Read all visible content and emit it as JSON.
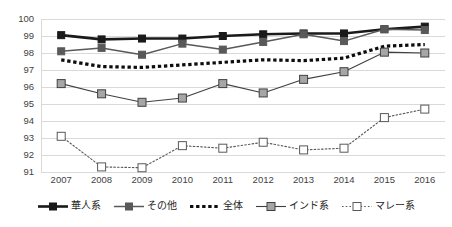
{
  "chart_data": {
    "type": "line",
    "title": "",
    "subtitle": "",
    "xlabel": "",
    "ylabel": "",
    "categories": [
      "2007",
      "2008",
      "2009",
      "2010",
      "2011",
      "2012",
      "2013",
      "2014",
      "2015",
      "2016"
    ],
    "x_tick_labels": [
      "2007",
      "2008",
      "2009",
      "2010",
      "2011",
      "2012",
      "2013",
      "2014",
      "2015",
      "2016"
    ],
    "y_tick_labels": [
      "100",
      "99",
      "98",
      "97",
      "96",
      "95",
      "94",
      "93",
      "92",
      "91"
    ],
    "ylim": [
      91,
      100
    ],
    "y_tick_step": 1,
    "grid": "horizontal",
    "legend_position": "bottom",
    "series": [
      {
        "name": "華人系",
        "values": [
          99.05,
          98.8,
          98.85,
          98.85,
          99.0,
          99.1,
          99.15,
          99.15,
          99.4,
          99.55
        ],
        "color": "#1a1a1a",
        "line_style": "solid",
        "line_width": 2.6,
        "marker": "square-filled",
        "marker_fill": "#1a1a1a",
        "marker_size": 7
      },
      {
        "name": "その他",
        "values": [
          98.1,
          98.3,
          97.9,
          98.55,
          98.2,
          98.65,
          99.1,
          98.7,
          99.4,
          99.35
        ],
        "color": "#595959",
        "line_style": "solid",
        "line_width": 1.5,
        "marker": "square-filled",
        "marker_fill": "#595959",
        "marker_size": 7
      },
      {
        "name": "全体",
        "values": [
          97.6,
          97.2,
          97.15,
          97.3,
          97.45,
          97.6,
          97.55,
          97.7,
          98.4,
          98.5
        ],
        "color": "#0d0d0d",
        "line_style": "dotted-thick",
        "line_width": 3.2,
        "marker": "none",
        "marker_fill": "none",
        "marker_size": 0
      },
      {
        "name": "インド系",
        "values": [
          96.2,
          95.6,
          95.1,
          95.35,
          96.2,
          95.65,
          96.45,
          96.9,
          98.05,
          98.0
        ],
        "color": "#404040",
        "line_style": "solid",
        "line_width": 1.1,
        "marker": "square-filled",
        "marker_fill": "#a6a6a6",
        "marker_size": 8
      },
      {
        "name": "マレー系",
        "values": [
          93.1,
          91.3,
          91.25,
          92.55,
          92.4,
          92.75,
          92.3,
          92.4,
          94.2,
          94.7
        ],
        "color": "#595959",
        "line_style": "dotted-fine",
        "line_width": 1.1,
        "marker": "square-open",
        "marker_fill": "#ffffff",
        "marker_size": 8
      }
    ]
  },
  "legend": {
    "items": [
      {
        "label": "華人系"
      },
      {
        "label": "その他"
      },
      {
        "label": "全体"
      },
      {
        "label": "インド系"
      },
      {
        "label": "マレー系"
      }
    ]
  },
  "colors": {
    "gridline": "#d9d9d9",
    "background": "#ffffff",
    "tick_text": "#3f3f3f"
  }
}
